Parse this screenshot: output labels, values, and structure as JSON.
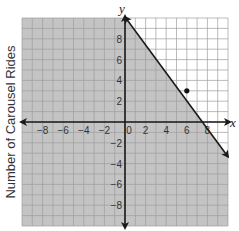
{
  "chart_data": {
    "type": "line",
    "title": "",
    "xlabel": "x",
    "ylabel": "y",
    "side_label": "Number of Carousel Rides",
    "xlim": [
      -10,
      10
    ],
    "ylim": [
      -10,
      10
    ],
    "grid": true,
    "x_ticks": [
      -8,
      -6,
      -4,
      -2,
      0,
      2,
      4,
      6,
      8
    ],
    "y_ticks": [
      -8,
      -6,
      -4,
      -2,
      2,
      4,
      6,
      8
    ],
    "x_tick_labels": [
      "−8",
      "−6",
      "−4",
      "−2",
      "0",
      "2",
      "4",
      "6",
      "8"
    ],
    "y_tick_labels": [
      "−8",
      "−6",
      "−4",
      "−2",
      "2",
      "4",
      "6",
      "8"
    ],
    "series": [
      {
        "name": "boundary line",
        "style": "solid",
        "points": [
          [
            0,
            10
          ],
          [
            7.5,
            0
          ],
          [
            10,
            -3.33
          ]
        ],
        "equation": "y = -4/3 x + 10",
        "arrows": "both"
      }
    ],
    "shaded_region": "below the boundary line (y <= -4/3 x + 10)",
    "points": [
      {
        "name": "dot",
        "x": 6,
        "y": 3
      }
    ]
  },
  "colors": {
    "shade": "#c4c4c4",
    "unshaded": "#ffffff",
    "grid_shaded": "#a8a8a8",
    "grid_unshaded": "#b5b5b5",
    "axis": "#1a1a1a",
    "text": "#333333"
  }
}
